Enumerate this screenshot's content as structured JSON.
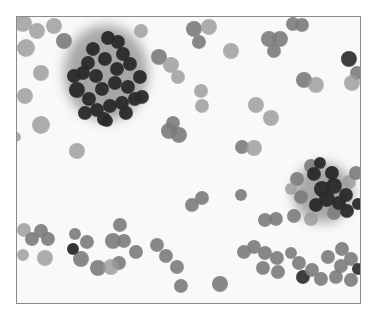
{
  "image": {
    "description": "Grayscale cytology micrograph: scattered round cells with two dense dark cell clusters",
    "frame": {
      "x": 16,
      "y": 16,
      "width": 345,
      "height": 288,
      "border_color": "#8a8a8a",
      "background": "#f9f9f9"
    },
    "colors": {
      "light_cell": "#9a9a9a",
      "mid_cell": "#7c7c7c",
      "dark_cell": "#2a2a2a",
      "haze": "#8c8c8c"
    },
    "clusters": [
      {
        "name": "upper-left-cluster",
        "cx": 105,
        "cy": 72,
        "rx": 42,
        "ry": 48
      },
      {
        "name": "right-cluster",
        "cx": 322,
        "cy": 192,
        "rx": 30,
        "ry": 30
      }
    ],
    "cells": [
      [
        22,
        22,
        9,
        "l"
      ],
      [
        36,
        30,
        8,
        "l"
      ],
      [
        53,
        25,
        8,
        "l"
      ],
      [
        63,
        40,
        8,
        "m"
      ],
      [
        25,
        47,
        9,
        "l"
      ],
      [
        40,
        72,
        8,
        "l"
      ],
      [
        24,
        95,
        8,
        "l"
      ],
      [
        40,
        124,
        9,
        "l"
      ],
      [
        76,
        150,
        8,
        "l"
      ],
      [
        140,
        30,
        7,
        "l"
      ],
      [
        158,
        56,
        8,
        "m"
      ],
      [
        170,
        64,
        8,
        "l"
      ],
      [
        177,
        76,
        7,
        "l"
      ],
      [
        168,
        130,
        8,
        "m"
      ],
      [
        178,
        134,
        8,
        "m"
      ],
      [
        172,
        122,
        7,
        "m"
      ],
      [
        193,
        28,
        8,
        "m"
      ],
      [
        208,
        26,
        8,
        "l"
      ],
      [
        198,
        41,
        7,
        "m"
      ],
      [
        230,
        50,
        8,
        "l"
      ],
      [
        268,
        38,
        8,
        "m"
      ],
      [
        279,
        38,
        8,
        "m"
      ],
      [
        273,
        50,
        7,
        "m"
      ],
      [
        292,
        23,
        7,
        "m"
      ],
      [
        301,
        24,
        7,
        "m"
      ],
      [
        348,
        58,
        8,
        "d"
      ],
      [
        356,
        72,
        7,
        "m"
      ],
      [
        351,
        82,
        8,
        "l"
      ],
      [
        303,
        79,
        8,
        "m"
      ],
      [
        315,
        84,
        8,
        "l"
      ],
      [
        200,
        90,
        7,
        "l"
      ],
      [
        255,
        104,
        8,
        "l"
      ],
      [
        270,
        117,
        8,
        "l"
      ],
      [
        241,
        146,
        7,
        "m"
      ],
      [
        253,
        147,
        8,
        "l"
      ],
      [
        201,
        105,
        7,
        "l"
      ],
      [
        15,
        136,
        5,
        "l"
      ],
      [
        23,
        229,
        7,
        "l"
      ],
      [
        31,
        238,
        7,
        "m"
      ],
      [
        40,
        230,
        7,
        "m"
      ],
      [
        47,
        238,
        7,
        "m"
      ],
      [
        44,
        257,
        8,
        "l"
      ],
      [
        22,
        254,
        6,
        "l"
      ],
      [
        74,
        233,
        6,
        "m"
      ],
      [
        86,
        241,
        7,
        "m"
      ],
      [
        80,
        258,
        8,
        "m"
      ],
      [
        97,
        267,
        8,
        "m"
      ],
      [
        112,
        240,
        8,
        "m"
      ],
      [
        123,
        240,
        7,
        "m"
      ],
      [
        135,
        251,
        7,
        "m"
      ],
      [
        118,
        262,
        7,
        "m"
      ],
      [
        110,
        266,
        8,
        "l"
      ],
      [
        156,
        244,
        7,
        "m"
      ],
      [
        165,
        255,
        7,
        "m"
      ],
      [
        176,
        266,
        7,
        "m"
      ],
      [
        180,
        285,
        7,
        "m"
      ],
      [
        119,
        224,
        7,
        "m"
      ],
      [
        191,
        204,
        7,
        "m"
      ],
      [
        201,
        197,
        7,
        "m"
      ],
      [
        240,
        194,
        6,
        "m"
      ],
      [
        219,
        283,
        8,
        "m"
      ],
      [
        264,
        219,
        7,
        "m"
      ],
      [
        275,
        218,
        7,
        "m"
      ],
      [
        293,
        215,
        7,
        "m"
      ],
      [
        310,
        218,
        7,
        "l"
      ],
      [
        333,
        212,
        7,
        "m"
      ],
      [
        243,
        251,
        7,
        "m"
      ],
      [
        253,
        246,
        7,
        "m"
      ],
      [
        264,
        252,
        7,
        "m"
      ],
      [
        262,
        267,
        7,
        "m"
      ],
      [
        276,
        257,
        7,
        "m"
      ],
      [
        277,
        271,
        7,
        "m"
      ],
      [
        290,
        252,
        6,
        "m"
      ],
      [
        298,
        262,
        7,
        "m"
      ],
      [
        302,
        276,
        7,
        "d"
      ],
      [
        311,
        269,
        7,
        "m"
      ],
      [
        320,
        278,
        7,
        "m"
      ],
      [
        327,
        256,
        7,
        "m"
      ],
      [
        341,
        248,
        7,
        "m"
      ],
      [
        350,
        258,
        7,
        "m"
      ],
      [
        340,
        265,
        7,
        "m"
      ],
      [
        335,
        276,
        7,
        "m"
      ],
      [
        350,
        279,
        7,
        "m"
      ],
      [
        357,
        268,
        6,
        "d"
      ],
      [
        296,
        178,
        7,
        "m"
      ],
      [
        300,
        196,
        7,
        "m"
      ],
      [
        310,
        165,
        7,
        "m"
      ],
      [
        290,
        188,
        6,
        "l"
      ],
      [
        348,
        181,
        7,
        "l"
      ],
      [
        355,
        172,
        7,
        "m"
      ]
    ],
    "dark_cells": [
      [
        107,
        37,
        7
      ],
      [
        117,
        41,
        7
      ],
      [
        92,
        48,
        7
      ],
      [
        122,
        53,
        7
      ],
      [
        87,
        62,
        7
      ],
      [
        104,
        58,
        7
      ],
      [
        82,
        72,
        7
      ],
      [
        95,
        75,
        7
      ],
      [
        116,
        68,
        7
      ],
      [
        129,
        63,
        7
      ],
      [
        76,
        89,
        8
      ],
      [
        88,
        98,
        7
      ],
      [
        101,
        88,
        7
      ],
      [
        114,
        82,
        7
      ],
      [
        127,
        86,
        7
      ],
      [
        139,
        76,
        7
      ],
      [
        134,
        98,
        7
      ],
      [
        96,
        109,
        7
      ],
      [
        109,
        105,
        7
      ],
      [
        121,
        102,
        7
      ],
      [
        84,
        112,
        7
      ],
      [
        103,
        118,
        7
      ],
      [
        125,
        112,
        7
      ],
      [
        141,
        96,
        7
      ],
      [
        106,
        120,
        6
      ],
      [
        73,
        75,
        7
      ],
      [
        313,
        173,
        7
      ],
      [
        321,
        188,
        8
      ],
      [
        333,
        185,
        8
      ],
      [
        326,
        198,
        8
      ],
      [
        315,
        204,
        7
      ],
      [
        338,
        202,
        7
      ],
      [
        345,
        194,
        7
      ],
      [
        346,
        210,
        7
      ],
      [
        357,
        203,
        6
      ],
      [
        319,
        162,
        6
      ],
      [
        331,
        172,
        7
      ],
      [
        72,
        248,
        6
      ]
    ]
  }
}
